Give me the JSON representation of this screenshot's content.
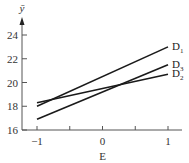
{
  "chart_data": {
    "type": "line",
    "title": "",
    "xlabel": "E",
    "ylabel": "ȳ",
    "x": [
      -1,
      1
    ],
    "xlim": [
      -1,
      1
    ],
    "ylim": [
      16,
      24
    ],
    "xticks": [
      -1,
      -0.5,
      0,
      0.5,
      1
    ],
    "xtick_labels": [
      "−1",
      "",
      "0",
      "",
      "1"
    ],
    "yticks": [
      16,
      18,
      20,
      22,
      24
    ],
    "ytick_labels": [
      "16",
      "18",
      "20",
      "22",
      "24"
    ],
    "grid": false,
    "legend_position": "inline-right",
    "series": [
      {
        "name": "D1",
        "label_main": "D",
        "label_sub": "1",
        "values": [
          18.0,
          23.0
        ]
      },
      {
        "name": "D3",
        "label_main": "D",
        "label_sub": "3",
        "values": [
          16.9,
          21.5
        ]
      },
      {
        "name": "D2",
        "label_main": "D",
        "label_sub": "2",
        "values": [
          18.3,
          20.7
        ]
      }
    ],
    "line_color": "#1a1a1a",
    "axis_color": "#555555"
  }
}
